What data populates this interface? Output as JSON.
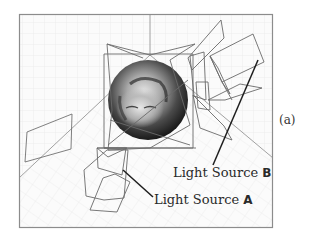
{
  "figure": {
    "panel_tag": "(a)",
    "labels": {
      "light_source_a": {
        "prefix": "Light Source ",
        "letter": "A"
      },
      "light_source_b": {
        "prefix": "Light Source ",
        "letter": "B"
      }
    },
    "colors": {
      "frame": "#8c8c8c",
      "grid": "#e4e4e4",
      "wireframe": "#6e6e6e",
      "leader_line": "#1e1e1e",
      "background": "#ffffff"
    }
  }
}
